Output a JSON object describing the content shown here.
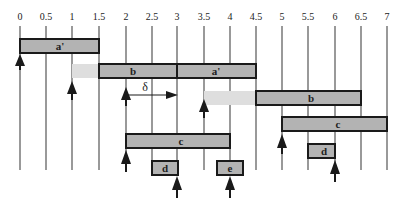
{
  "axis": {
    "ticks": [
      "0",
      "0.5",
      "1",
      "1.5",
      "2",
      "2.5",
      "3",
      "3.5",
      "4",
      "4.5",
      "5",
      "5.5",
      "6",
      "6.5",
      "7"
    ]
  },
  "bars": {
    "a_prime_top": "a'",
    "b_first": "b",
    "a_prime_second": "a'",
    "b_second": "b",
    "c_right": "c",
    "c_left": "c",
    "d_left": "d",
    "e": "e",
    "d_right": "d"
  },
  "delta_label": "δ",
  "colors": {
    "bar_fill": "#b3b3b3",
    "bar_stroke": "#1a1a1a",
    "light_fill": "#dcdcdc",
    "grid": "#444444"
  }
}
